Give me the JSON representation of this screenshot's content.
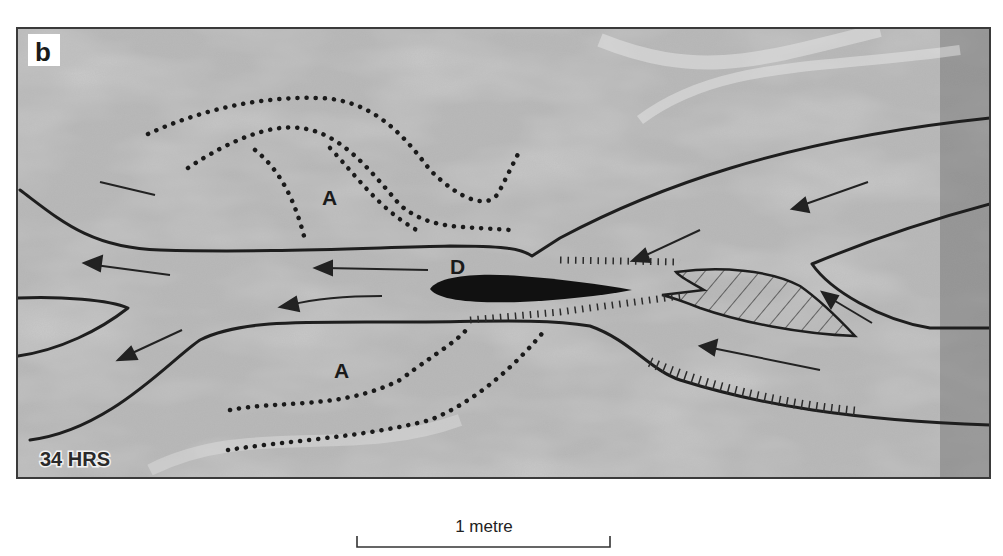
{
  "figure": {
    "panel_label": "b",
    "time_label": "34 HRS",
    "bar_labels": [
      "A",
      "A"
    ],
    "channel_label": "D",
    "scale_bar": {
      "label": "1 metre"
    }
  },
  "colors": {
    "photo_base": "#b9b9b9",
    "line": "#1e1e1e",
    "frame": "#3a3a3a",
    "background": "#ffffff"
  }
}
